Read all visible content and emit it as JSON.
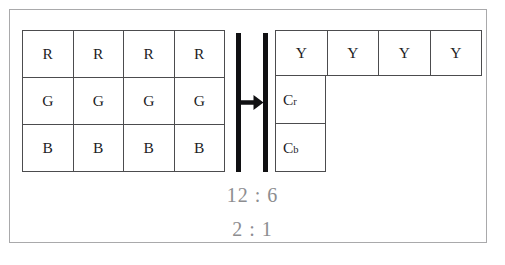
{
  "figure": {
    "frame_color": "#a9a9ab",
    "line_color": "#4c4c4e",
    "bar_color": "#101012",
    "text_color": "#1d1d1f",
    "caption_color": "#8d8d90"
  },
  "rgb_grid": {
    "name": "RGB sample grid",
    "columns": 4,
    "rows": 3,
    "row_labels": [
      "R",
      "G",
      "B"
    ],
    "cells": [
      [
        "R",
        "R",
        "R",
        "R"
      ],
      [
        "G",
        "G",
        "G",
        "G"
      ],
      [
        "B",
        "B",
        "B",
        "B"
      ]
    ]
  },
  "separator": {
    "arrow_icon": "right-arrow-icon",
    "bar_count": 2
  },
  "ycc_table": {
    "name": "YCrCb sample grid",
    "luma_label": "Y",
    "luma_cells": [
      "Y",
      "Y",
      "Y",
      "Y"
    ],
    "chroma": [
      {
        "base": "C",
        "sub": "r"
      },
      {
        "base": "C",
        "sub": "b"
      }
    ]
  },
  "captions": {
    "primary": "12 : 6",
    "secondary": "2 : 1"
  }
}
